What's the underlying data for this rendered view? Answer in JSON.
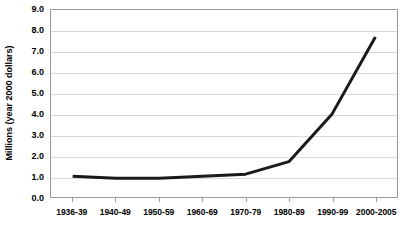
{
  "chart_data": {
    "type": "line",
    "title": "",
    "subtitle": "",
    "xlabel": "",
    "ylabel": "Millions (year 2000 dollars)",
    "categories": [
      "1936-39",
      "1940-49",
      "1950-59",
      "1960-69",
      "1970-79",
      "1980-89",
      "1990-99",
      "2000-2005"
    ],
    "values": [
      1.0,
      0.9,
      0.9,
      1.0,
      1.1,
      1.7,
      4.0,
      7.7
    ],
    "series": [
      {
        "name": "",
        "values": [
          1.0,
          0.9,
          0.9,
          1.0,
          1.1,
          1.7,
          4.0,
          7.7
        ]
      }
    ],
    "ylim": [
      0.0,
      9.0
    ],
    "ytick_labels": [
      "0.0",
      "1.0",
      "2.0",
      "3.0",
      "4.0",
      "5.0",
      "6.0",
      "7.0",
      "8.0",
      "9.0"
    ],
    "ytick_values": [
      0.0,
      1.0,
      2.0,
      3.0,
      4.0,
      5.0,
      6.0,
      7.0,
      8.0,
      9.0
    ],
    "grid": true,
    "grid_axis": "y",
    "legend": false,
    "legend_position": "none",
    "annotations": [],
    "line_color": "#1a1a1a",
    "line_width": 3,
    "grid_color": "#d9d9d9",
    "axis_color": "#9a9a9a",
    "plot_background": "#ffffff",
    "text_color": "#000000"
  }
}
